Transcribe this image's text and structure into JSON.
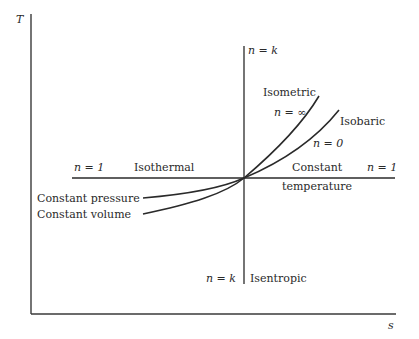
{
  "diagram": {
    "axes": {
      "y_label": "T",
      "x_label": "s"
    },
    "lines": {
      "vertical_top_label": "n = k",
      "vertical_bottom_label_n": "n = k",
      "vertical_bottom_label_name": "Isentropic",
      "horizontal_left_n": "n = 1",
      "horizontal_left_name": "Isothermal",
      "horizontal_right_name_1": "Constant",
      "horizontal_right_name_2": "temperature",
      "horizontal_right_n": "n = 1"
    },
    "curves": {
      "isometric_name": "Isometric",
      "isometric_n": "n = ∞",
      "isobaric_name": "Isobaric",
      "isobaric_n": "n = 0",
      "constant_pressure": "Constant pressure",
      "constant_volume": "Constant volume"
    },
    "colors": {
      "ink": "#2a2a2a",
      "background": "#ffffff"
    }
  }
}
